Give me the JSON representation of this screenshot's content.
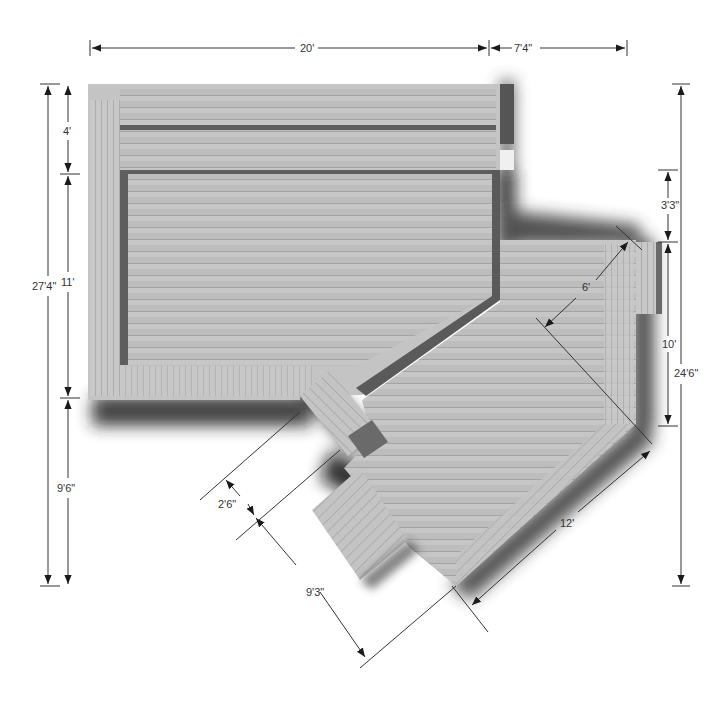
{
  "diagram": {
    "type": "deck-plan-top-view",
    "colors": {
      "background": "#ffffff",
      "deck_board": "#bdbdbd",
      "deck_board_light": "#c9c9c9",
      "board_line": "#a8a8a8",
      "border_trim": "#c4c4c4",
      "inner_shadow": "#6b6b6b",
      "drop_shadow": "#2a2a2a",
      "dimension_line": "#333333"
    },
    "dimensions": {
      "top_width_main": "20'",
      "top_width_extension": "7'4\"",
      "left_total_height": "27'4\"",
      "left_upper_section": "4'",
      "left_middle_section": "11'",
      "left_lower_section": "9'6\"",
      "right_step_offset": "3'3\"",
      "right_lower_section": "10'",
      "right_total_height": "24'6\"",
      "diagonal_inner": "6'",
      "diagonal_outer_edge": "12'",
      "stair_width": "2'6\"",
      "stair_run": "9'3\""
    }
  }
}
